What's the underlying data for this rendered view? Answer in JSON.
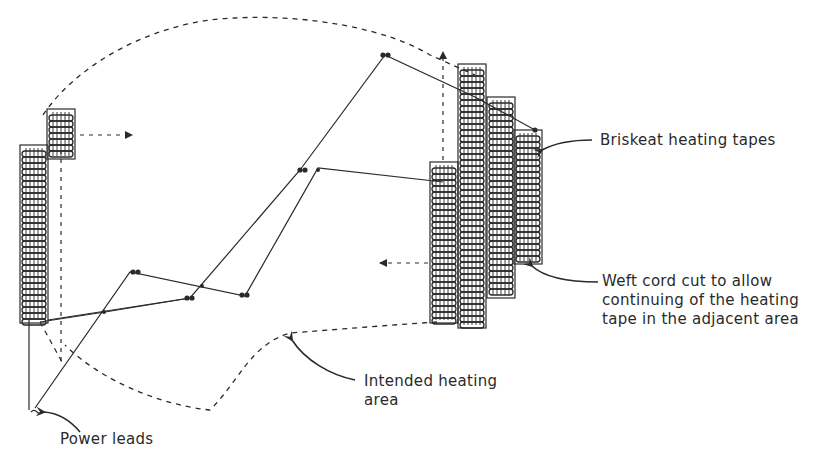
{
  "diagram": {
    "type": "technical-illustration",
    "labels": {
      "briskeat": "Briskeat heating tapes",
      "weft_line1": "Weft cord cut to allow",
      "weft_line2": "continuing of the heating",
      "weft_line3": "tape in the adjacent area",
      "intended_line1": "Intended heating",
      "intended_line2": "area",
      "power": "Power leads"
    },
    "components": [
      {
        "id": "left-tape-small",
        "kind": "heating-tape"
      },
      {
        "id": "left-tape-tall",
        "kind": "heating-tape"
      },
      {
        "id": "right-tape-1",
        "kind": "heating-tape"
      },
      {
        "id": "right-tape-2",
        "kind": "heating-tape"
      },
      {
        "id": "right-tape-3",
        "kind": "heating-tape"
      },
      {
        "id": "right-tape-4",
        "kind": "heating-tape"
      },
      {
        "id": "wire-network",
        "kind": "connecting-wires"
      },
      {
        "id": "intended-area-boundary",
        "kind": "dashed-outline"
      },
      {
        "id": "power-leads",
        "kind": "lead-wires"
      }
    ],
    "colors": {
      "ink": "#2a2a2a",
      "background": "#ffffff"
    }
  }
}
